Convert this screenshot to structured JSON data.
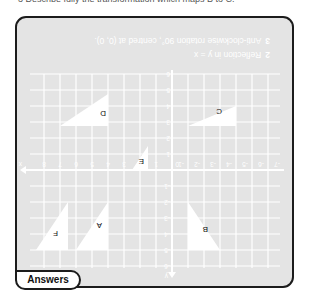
{
  "question": {
    "text": "3  Describe fully the transformation which maps B to C."
  },
  "answers_panel": {
    "tab_label": "Answers",
    "items": [
      {
        "number": "2",
        "text": "Reflection in y = x"
      },
      {
        "number": "3",
        "text": "Anti-clockwise rotation 90°, centred at (0, 0)."
      }
    ]
  },
  "grid": {
    "x_axis_label": "x",
    "y_axis_label": "y",
    "x_ticks": [
      "-7",
      "-6",
      "-5",
      "-4",
      "-3",
      "-2",
      "-1",
      "0",
      "1",
      "2",
      "3",
      "4",
      "5",
      "6",
      "7",
      "8"
    ],
    "y_ticks": [
      "-6",
      "-5",
      "-4",
      "-3",
      "-2",
      "-1",
      "0",
      "1",
      "2",
      "3",
      "4",
      "5",
      "6"
    ],
    "shapes": [
      {
        "label": "A"
      },
      {
        "label": "B"
      },
      {
        "label": "C"
      },
      {
        "label": "D"
      },
      {
        "label": "E"
      },
      {
        "label": "F"
      }
    ],
    "colors": {
      "background": "#e4e4e4",
      "gridline": "#ffffff",
      "shape_fill": "#ffffff",
      "border": "#1c1c1c"
    }
  }
}
